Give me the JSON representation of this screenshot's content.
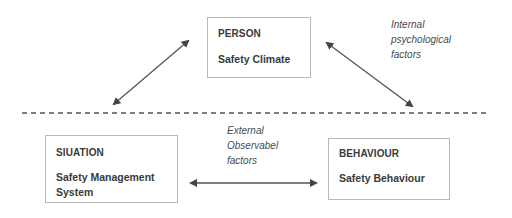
{
  "diagram": {
    "nodes": [
      {
        "id": "person",
        "title": "PERSON",
        "subtitle": "Safety Climate"
      },
      {
        "id": "situation",
        "title": "SIUATION",
        "subtitle_line1": "Safety Management",
        "subtitle_line2": "System"
      },
      {
        "id": "behaviour",
        "title": "BEHAVIOUR",
        "subtitle": "Safety Behaviour"
      }
    ],
    "annotations": {
      "internal": {
        "line1": "Internal",
        "line2": "psychological",
        "line3": "factors"
      },
      "external": {
        "line1": "External",
        "line2": "Observabel",
        "line3": "factors"
      }
    },
    "edges": [
      {
        "from": "person",
        "to": "situation",
        "type": "bidirectional"
      },
      {
        "from": "person",
        "to": "behaviour",
        "type": "bidirectional"
      },
      {
        "from": "situation",
        "to": "behaviour",
        "type": "bidirectional"
      }
    ],
    "divider": "dashed",
    "colors": {
      "line": "#555555",
      "border": "#b8b8b8",
      "text": "#3a3a3a"
    }
  }
}
